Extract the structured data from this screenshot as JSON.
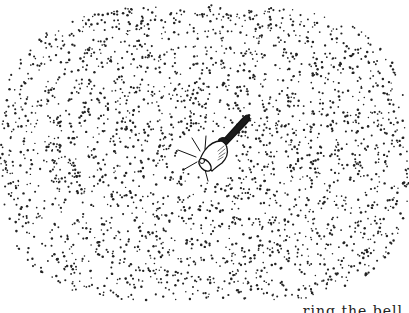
{
  "illustration": {
    "subject": "hand bell ringing",
    "icon": "bell-icon",
    "background_color": "#ffffff",
    "dot_color": "#222222",
    "line_color": "#111111",
    "field": {
      "center": [
        205,
        155
      ],
      "rx": 205,
      "ry": 150,
      "ring_spacing": 22,
      "dot_count": 2600,
      "seed": 7
    },
    "bell": {
      "mouth_center": [
        203,
        160
      ],
      "handle_tip": [
        246,
        117
      ]
    }
  },
  "caption": {
    "text": "… ring the bell"
  }
}
